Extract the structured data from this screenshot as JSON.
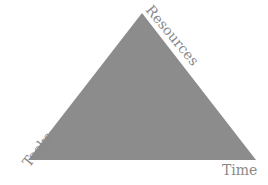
{
  "diagram": {
    "type": "project-management-triangle",
    "shape_color": "#8c8c8c",
    "label_color": "#8a8a8a",
    "vertices": {
      "apex": [
        142,
        13
      ],
      "bottom_left": [
        28,
        160
      ],
      "bottom_right": [
        256,
        160
      ]
    },
    "labels": {
      "resources": "Resources",
      "tasks": "Tasks",
      "time": "Time"
    }
  }
}
